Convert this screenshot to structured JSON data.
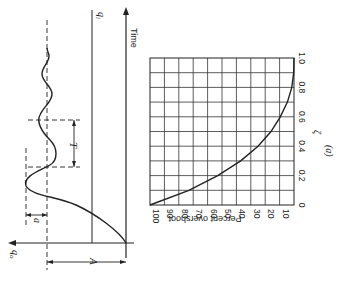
{
  "figure": {
    "label": "(a)",
    "rotation_deg": 90
  },
  "response_plot": {
    "time_axis_label": "Time",
    "input_label": "q",
    "input_subscript": "i",
    "output_label": "q",
    "output_subscript": "o",
    "amplitude_label": "A",
    "overshoot_label": "a",
    "period_label": "T"
  },
  "chart_data": {
    "type": "line",
    "title": "",
    "xlabel": "ζ",
    "ylabel": "Percent overshoot",
    "x": [
      0,
      0.1,
      0.2,
      0.3,
      0.4,
      0.5,
      0.6,
      0.7,
      0.8,
      0.9,
      1.0
    ],
    "values": [
      100,
      73,
      53,
      37,
      25,
      16,
      9.5,
      4.6,
      1.5,
      0.2,
      0
    ],
    "xlim": [
      0,
      1.0
    ],
    "ylim": [
      0,
      100
    ],
    "x_ticks": [
      "0",
      "0.2",
      "0.4",
      "0.6",
      "0.8",
      "1.0"
    ],
    "y_ticks": [
      "100",
      "90",
      "80",
      "70",
      "60",
      "50",
      "40",
      "30",
      "20",
      "10"
    ],
    "grid": true
  }
}
